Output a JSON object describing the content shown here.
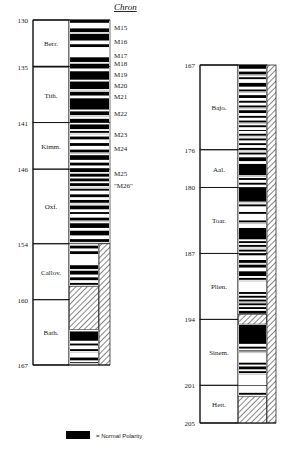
{
  "chron_header": "Chron",
  "legend": {
    "swatch_color": "#000000",
    "label": "= Normal Polarity"
  },
  "columns": [
    {
      "name": "left",
      "age_range": [
        130,
        167
      ],
      "age_ticks": [
        130,
        135,
        141,
        146,
        154,
        160,
        167
      ],
      "stages": [
        {
          "label": "Berr.",
          "from": 130,
          "to": 135
        },
        {
          "label": "Tith.",
          "from": 135,
          "to": 141
        },
        {
          "label": "Kimm.",
          "from": 141,
          "to": 146
        },
        {
          "label": "Oxf.",
          "from": 146,
          "to": 154
        },
        {
          "label": "Callov.",
          "from": 154,
          "to": 160
        },
        {
          "label": "Bath.",
          "from": 160,
          "to": 167
        }
      ],
      "chrons": [
        {
          "label": "M15",
          "age": 130.8
        },
        {
          "label": "M16",
          "age": 132.3
        },
        {
          "label": "M17",
          "age": 133.7
        },
        {
          "label": "M18",
          "age": 134.6
        },
        {
          "label": "M19",
          "age": 135.8
        },
        {
          "label": "M20",
          "age": 137.0
        },
        {
          "label": "M21",
          "age": 138.2
        },
        {
          "label": "M22",
          "age": 140.0
        },
        {
          "label": "M23",
          "age": 142.2
        },
        {
          "label": "M24",
          "age": 143.7
        },
        {
          "label": "M25",
          "age": 146.4
        },
        {
          "label": "\"M26\"",
          "age": 147.7
        }
      ],
      "normal_bands": [
        [
          130.0,
          130.3
        ],
        [
          130.9,
          131.3
        ],
        [
          131.5,
          132.2
        ],
        [
          132.6,
          132.9
        ],
        [
          134.0,
          134.5
        ],
        [
          134.7,
          135.2
        ],
        [
          135.5,
          136.4
        ],
        [
          136.6,
          137.4
        ],
        [
          137.7,
          138.1
        ],
        [
          138.4,
          139.6
        ],
        [
          139.8,
          140.2
        ],
        [
          140.6,
          141.0
        ],
        [
          141.2,
          141.7
        ],
        [
          141.9,
          142.1
        ],
        [
          142.5,
          142.8
        ],
        [
          143.2,
          143.5
        ],
        [
          143.9,
          144.2
        ],
        [
          144.5,
          145.0
        ],
        [
          145.3,
          145.6
        ],
        [
          145.9,
          146.3
        ],
        [
          146.5,
          146.8
        ],
        [
          147.0,
          147.3
        ],
        [
          147.5,
          147.8
        ],
        [
          148.1,
          148.3
        ],
        [
          148.7,
          149.0
        ],
        [
          149.3,
          149.6
        ],
        [
          149.9,
          150.3
        ],
        [
          150.6,
          150.8
        ],
        [
          151.2,
          151.5
        ],
        [
          151.8,
          152.3
        ],
        [
          152.6,
          153.1
        ],
        [
          153.5,
          153.8
        ],
        [
          154.2,
          154.5
        ],
        [
          154.8,
          155.1
        ],
        [
          156.3,
          156.7
        ],
        [
          156.9,
          157.3
        ],
        [
          157.6,
          157.9
        ],
        [
          158.2,
          158.4
        ],
        [
          163.4,
          164.4
        ],
        [
          164.7,
          164.9
        ],
        [
          165.3,
          165.5
        ],
        [
          166.2,
          166.5
        ],
        [
          166.7,
          166.8
        ]
      ],
      "hatched_polarity": [
        [
          158.6,
          163.2
        ]
      ],
      "hatched_side": [
        [
          154.0,
          167.0
        ]
      ]
    },
    {
      "name": "right",
      "age_range": [
        167,
        205
      ],
      "age_ticks": [
        167,
        176,
        180,
        187,
        194,
        201,
        205
      ],
      "stages": [
        {
          "label": "Bajo.",
          "from": 167,
          "to": 176
        },
        {
          "label": "Aal.",
          "from": 176,
          "to": 180
        },
        {
          "label": "Toar.",
          "from": 180,
          "to": 187
        },
        {
          "label": "Plien.",
          "from": 187,
          "to": 194
        },
        {
          "label": "Sinem.",
          "from": 194,
          "to": 201
        },
        {
          "label": "Hett.",
          "from": 201,
          "to": 205
        }
      ],
      "chrons": [],
      "normal_bands": [
        [
          167.0,
          167.4
        ],
        [
          167.7,
          168.0
        ],
        [
          168.3,
          168.5
        ],
        [
          168.9,
          169.3
        ],
        [
          169.6,
          169.8
        ],
        [
          170.2,
          170.5
        ],
        [
          170.8,
          171.0
        ],
        [
          171.3,
          171.5
        ],
        [
          171.8,
          172.1
        ],
        [
          172.4,
          172.6
        ],
        [
          172.9,
          173.1
        ],
        [
          173.4,
          173.6
        ],
        [
          173.9,
          174.0
        ],
        [
          174.3,
          174.5
        ],
        [
          174.8,
          175.0
        ],
        [
          175.3,
          175.5
        ],
        [
          175.8,
          176.0
        ],
        [
          176.3,
          176.5
        ],
        [
          176.8,
          177.2
        ],
        [
          177.5,
          178.7
        ],
        [
          179.0,
          179.2
        ],
        [
          179.5,
          179.7
        ],
        [
          180.0,
          181.5
        ],
        [
          181.8,
          182.0
        ],
        [
          182.6,
          182.8
        ],
        [
          183.5,
          183.7
        ],
        [
          184.3,
          185.5
        ],
        [
          185.7,
          185.9
        ],
        [
          186.1,
          186.3
        ],
        [
          186.6,
          186.8
        ],
        [
          187.0,
          187.2
        ],
        [
          187.7,
          188.0
        ],
        [
          188.2,
          188.5
        ],
        [
          188.9,
          189.4
        ],
        [
          189.6,
          189.8
        ],
        [
          191.1,
          191.3
        ],
        [
          191.5,
          191.7
        ],
        [
          191.9,
          192.1
        ],
        [
          192.3,
          192.5
        ],
        [
          192.7,
          192.9
        ],
        [
          193.1,
          193.4
        ],
        [
          194.6,
          196.6
        ],
        [
          196.9,
          197.1
        ],
        [
          197.3,
          197.4
        ],
        [
          198.6,
          198.8
        ],
        [
          199.0,
          199.3
        ],
        [
          199.5,
          199.7
        ],
        [
          201.8,
          202.0
        ]
      ],
      "hatched_polarity": [
        [
          193.5,
          194.5
        ],
        [
          202.2,
          205.0
        ]
      ],
      "hatched_side": [
        [
          167.0,
          205.0
        ]
      ]
    }
  ]
}
